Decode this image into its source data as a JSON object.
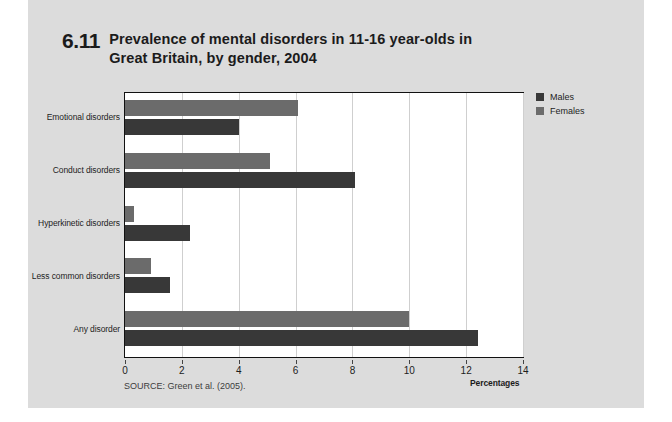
{
  "figure": {
    "number": "6.11",
    "title_line1": "Prevalence of mental disorders in 11-16 year-olds in",
    "title_line2": "Great Britain, by gender, 2004",
    "source": "SOURCE: Green et al. (2005)."
  },
  "legend": {
    "items": [
      {
        "label": "Males",
        "color": "#383838",
        "swatch_name": "legend-swatch-males"
      },
      {
        "label": "Females",
        "color": "#6b6b6b",
        "swatch_name": "legend-swatch-females"
      }
    ]
  },
  "axis": {
    "x_title": "Percentages",
    "ticks": [
      "0",
      "2",
      "4",
      "6",
      "8",
      "10",
      "12",
      "14"
    ]
  },
  "chart_data": {
    "type": "bar",
    "orientation": "horizontal",
    "title": "6.11 Prevalence of mental disorders in 11-16 year-olds in Great Britain, by gender, 2004",
    "subtitle": "",
    "xlabel": "Percentages",
    "ylabel": "",
    "xlim": [
      0,
      14
    ],
    "xticks": [
      0,
      2,
      4,
      6,
      8,
      10,
      12,
      14
    ],
    "grid": "vertical",
    "legend_position": "right",
    "categories": [
      "Emotional disorders",
      "Conduct disorders",
      "Hyperkinetic disorders",
      "Less common disorders",
      "Any disorder"
    ],
    "series": [
      {
        "name": "Females",
        "color": "#6b6b6b",
        "values": [
          6.1,
          5.1,
          0.3,
          0.9,
          10.0
        ]
      },
      {
        "name": "Males",
        "color": "#383838",
        "values": [
          4.0,
          8.1,
          2.3,
          1.6,
          12.4
        ]
      }
    ],
    "annotations": [
      "SOURCE: Green et al. (2005)."
    ]
  }
}
